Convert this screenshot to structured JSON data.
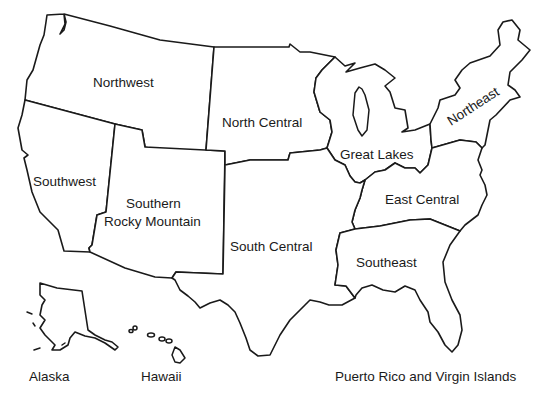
{
  "map": {
    "title": "United States regions",
    "line_color": "#1a1a1a",
    "background": "#ffffff",
    "regions": [
      {
        "id": "northwest",
        "label": "Northwest"
      },
      {
        "id": "north-central",
        "label": "North Central"
      },
      {
        "id": "great-lakes",
        "label": "Great Lakes"
      },
      {
        "id": "northeast",
        "label": "Northeast"
      },
      {
        "id": "southwest",
        "label": "Southwest"
      },
      {
        "id": "southern-rocky-mountain",
        "label_line1": "Southern",
        "label_line2": "Rocky Mountain"
      },
      {
        "id": "south-central",
        "label": "South Central"
      },
      {
        "id": "east-central",
        "label": "East Central"
      },
      {
        "id": "southeast",
        "label": "Southeast"
      }
    ],
    "insets": [
      {
        "id": "alaska",
        "label": "Alaska"
      },
      {
        "id": "hawaii",
        "label": "Hawaii"
      },
      {
        "id": "puerto-rico",
        "label": "Puerto Rico and Virgin Islands"
      }
    ]
  }
}
